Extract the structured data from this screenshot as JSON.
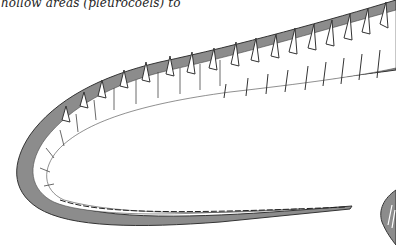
{
  "page": {
    "caption_fragment": "hollow areas (pleurocoels) to"
  },
  "figure": {
    "colors": {
      "body_fill": "#8c8c8c",
      "outline": "#3a3a3a",
      "bone": "#ffffff",
      "background": "#ffffff"
    }
  }
}
